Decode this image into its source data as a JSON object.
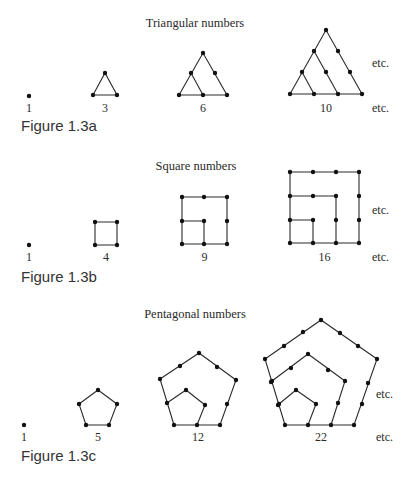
{
  "figures": [
    {
      "id": "1.3a",
      "caption": "Figure 1.3a",
      "title": "Triangular numbers",
      "etc_labels": [
        "etc.",
        "etc."
      ],
      "items": [
        {
          "label": "1",
          "dots": [
            [
              29,
              96
            ]
          ],
          "edges": []
        },
        {
          "label": "3",
          "dots": [
            [
              105,
              73
            ],
            [
              93,
              95
            ],
            [
              117,
              95
            ]
          ],
          "edges": [
            [
              [
                93,
                95
              ],
              [
                105,
                73
              ],
              [
                117,
                95
              ],
              [
                93,
                95
              ]
            ]
          ]
        },
        {
          "label": "6",
          "dots": [
            [
              203,
              53
            ],
            [
              191,
              73
            ],
            [
              215,
              73
            ],
            [
              179,
              95
            ],
            [
              203,
              95
            ],
            [
              227,
              95
            ]
          ],
          "edges": [
            [
              [
                179,
                95
              ],
              [
                203,
                53
              ],
              [
                227,
                95
              ],
              [
                179,
                95
              ]
            ],
            [
              [
                191,
                73
              ],
              [
                203,
                95
              ]
            ]
          ]
        },
        {
          "label": "10",
          "dots": [
            [
              326,
              30
            ],
            [
              314,
              51
            ],
            [
              338,
              51
            ],
            [
              302,
              72
            ],
            [
              326,
              72
            ],
            [
              350,
              72
            ],
            [
              290,
              94
            ],
            [
              314,
              94
            ],
            [
              338,
              94
            ],
            [
              362,
              94
            ]
          ],
          "edges": [
            [
              [
                290,
                94
              ],
              [
                326,
                30
              ],
              [
                362,
                94
              ],
              [
                290,
                94
              ]
            ],
            [
              [
                314,
                51
              ],
              [
                338,
                94
              ]
            ],
            [
              [
                302,
                72
              ],
              [
                314,
                94
              ]
            ]
          ]
        }
      ],
      "layout": {
        "title_xy": [
          213,
          27
        ],
        "label_y": 112,
        "etc_xy": [
          [
            372,
            67
          ],
          [
            372,
            112
          ]
        ],
        "caption_xy": [
          21,
          131
        ]
      }
    },
    {
      "id": "1.3b",
      "caption": "Figure 1.3b",
      "title": "Square numbers",
      "etc_labels": [
        "etc.",
        "etc."
      ],
      "items": [
        {
          "label": "1",
          "dots": [
            [
              29,
              245
            ]
          ],
          "edges": []
        },
        {
          "label": "4",
          "dots": [
            [
              95,
              222
            ],
            [
              117,
              222
            ],
            [
              95,
              245
            ],
            [
              117,
              245
            ]
          ],
          "edges": [
            [
              [
                95,
                222
              ],
              [
                117,
                222
              ],
              [
                117,
                245
              ],
              [
                95,
                245
              ],
              [
                95,
                222
              ]
            ]
          ]
        },
        {
          "label": "9",
          "dots": [
            [
              182,
              197
            ],
            [
              204,
              197
            ],
            [
              227,
              197
            ],
            [
              182,
              221
            ],
            [
              204,
              221
            ],
            [
              227,
              221
            ],
            [
              182,
              244
            ],
            [
              204,
              244
            ],
            [
              227,
              244
            ]
          ],
          "edges": [
            [
              [
                182,
                197
              ],
              [
                227,
                197
              ],
              [
                227,
                244
              ],
              [
                182,
                244
              ],
              [
                182,
                197
              ]
            ],
            [
              [
                182,
                221
              ],
              [
                204,
                221
              ],
              [
                204,
                244
              ]
            ]
          ]
        },
        {
          "label": "16",
          "dots": [
            [
              290,
              172
            ],
            [
              313,
              172
            ],
            [
              336,
              172
            ],
            [
              359,
              172
            ],
            [
              290,
              196
            ],
            [
              313,
              196
            ],
            [
              336,
              196
            ],
            [
              359,
              196
            ],
            [
              290,
              220
            ],
            [
              313,
              220
            ],
            [
              336,
              220
            ],
            [
              359,
              220
            ],
            [
              290,
              243
            ],
            [
              313,
              243
            ],
            [
              336,
              243
            ],
            [
              359,
              243
            ]
          ],
          "edges": [
            [
              [
                290,
                172
              ],
              [
                359,
                172
              ],
              [
                359,
                243
              ],
              [
                290,
                243
              ],
              [
                290,
                172
              ]
            ],
            [
              [
                290,
                196
              ],
              [
                336,
                196
              ],
              [
                336,
                243
              ]
            ],
            [
              [
                290,
                220
              ],
              [
                313,
                220
              ],
              [
                313,
                243
              ]
            ]
          ]
        }
      ],
      "layout": {
        "title_xy": [
          196,
          170
        ],
        "label_y": 261,
        "etc_xy": [
          [
            372,
            214
          ],
          [
            372,
            261
          ]
        ],
        "caption_xy": [
          21,
          282
        ]
      }
    },
    {
      "id": "1.3c",
      "caption": "Figure 1.3c",
      "title": "Pentagonal numbers",
      "etc_labels": [
        "etc.",
        "etc."
      ],
      "items": [
        {
          "label": "1",
          "dots": [
            [
              24,
              425
            ]
          ],
          "edges": []
        },
        {
          "label": "5",
          "dots": [
            [
              98,
              390
            ],
            [
              79,
              404
            ],
            [
              117,
              404
            ],
            [
              86,
              425
            ],
            [
              109,
              425
            ]
          ],
          "edges": [
            [
              [
                86,
                425
              ],
              [
                79,
                404
              ],
              [
                98,
                390
              ],
              [
                117,
                404
              ],
              [
                109,
                425
              ],
              [
                86,
                425
              ]
            ]
          ]
        },
        {
          "label": "12",
          "dots": [
            [
              199,
              353
            ],
            [
              180,
              366
            ],
            [
              217,
              367
            ],
            [
              160,
              379
            ],
            [
              236,
              380
            ],
            [
              167,
              403
            ],
            [
              227,
              404
            ],
            [
              174,
              425
            ],
            [
              197,
              425
            ],
            [
              220,
              425
            ],
            [
              186,
              390
            ],
            [
              205,
              405
            ]
          ],
          "edges": [
            [
              [
                174,
                425
              ],
              [
                160,
                379
              ],
              [
                199,
                353
              ],
              [
                236,
                380
              ],
              [
                220,
                425
              ],
              [
                174,
                425
              ]
            ],
            [
              [
                167,
                403
              ],
              [
                186,
                390
              ],
              [
                205,
                405
              ],
              [
                197,
                425
              ]
            ]
          ]
        },
        {
          "label": "22",
          "dots": [
            [
              321,
              320
            ],
            [
              303,
              332
            ],
            [
              340,
              333
            ],
            [
              284,
              346
            ],
            [
              358,
              346
            ],
            [
              265,
              359
            ],
            [
              377,
              359
            ],
            [
              271,
              382
            ],
            [
              368,
              383
            ],
            [
              278,
              405
            ],
            [
              362,
              404
            ],
            [
              285,
              425
            ],
            [
              308,
              425
            ],
            [
              331,
              425
            ],
            [
              354,
              425
            ],
            [
              308,
              354
            ],
            [
              291,
              368
            ],
            [
              328,
              370
            ],
            [
              272,
              381
            ],
            [
              345,
              381
            ],
            [
              279,
              404
            ],
            [
              338,
              403
            ],
            [
              296,
              390
            ],
            [
              316,
              404
            ]
          ],
          "edges": [
            [
              [
                285,
                425
              ],
              [
                265,
                359
              ],
              [
                321,
                320
              ],
              [
                377,
                359
              ],
              [
                354,
                425
              ],
              [
                285,
                425
              ]
            ],
            [
              [
                272,
                381
              ],
              [
                308,
                354
              ],
              [
                345,
                381
              ],
              [
                331,
                425
              ]
            ],
            [
              [
                279,
                404
              ],
              [
                296,
                390
              ],
              [
                316,
                404
              ],
              [
                308,
                425
              ]
            ]
          ]
        }
      ],
      "layout": {
        "title_xy": [
          195,
          318
        ],
        "label_y": 441,
        "etc_xy": [
          [
            376,
            398
          ],
          [
            376,
            441
          ]
        ],
        "caption_xy": [
          21,
          461
        ]
      }
    }
  ]
}
